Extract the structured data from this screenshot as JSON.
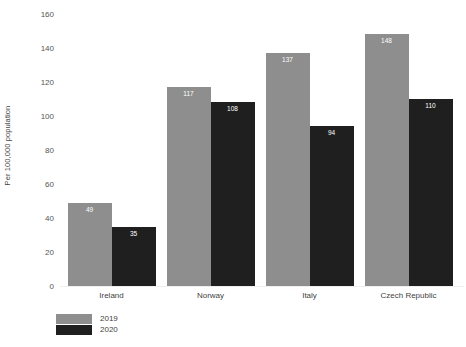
{
  "chart_data": {
    "type": "bar",
    "title": "",
    "subtitle": "",
    "xlabel": "",
    "ylabel": "Per 100,000 population",
    "ylim": [
      0,
      160
    ],
    "ytick_labels": [
      "160",
      "140",
      "120",
      "100",
      "80",
      "60",
      "40",
      "20",
      "0"
    ],
    "yticks": [
      160,
      140,
      120,
      100,
      80,
      60,
      40,
      20,
      0
    ],
    "grid": false,
    "legend_position": "bottom-left",
    "categories": [
      "Ireland",
      "Norway",
      "Italy",
      "Czech Republic"
    ],
    "series": [
      {
        "name": "2019",
        "color": "#8e8e8e",
        "values": [
          49,
          117,
          137,
          148
        ],
        "labels": [
          "49",
          "117",
          "137",
          "148"
        ]
      },
      {
        "name": "2020",
        "color": "#1f1f1f",
        "values": [
          35,
          108,
          94,
          110
        ],
        "labels": [
          "35",
          "108",
          "94",
          "110"
        ]
      }
    ]
  },
  "legend": {
    "entries": [
      {
        "label": "2019",
        "color": "#8e8e8e"
      },
      {
        "label": "2020",
        "color": "#1f1f1f"
      }
    ]
  },
  "colors": {
    "series_2019": "#8e8e8e",
    "series_2020": "#1f1f1f",
    "baseline": "#f0eeee",
    "text": "#3f3f3f",
    "background": "#ffffff"
  }
}
